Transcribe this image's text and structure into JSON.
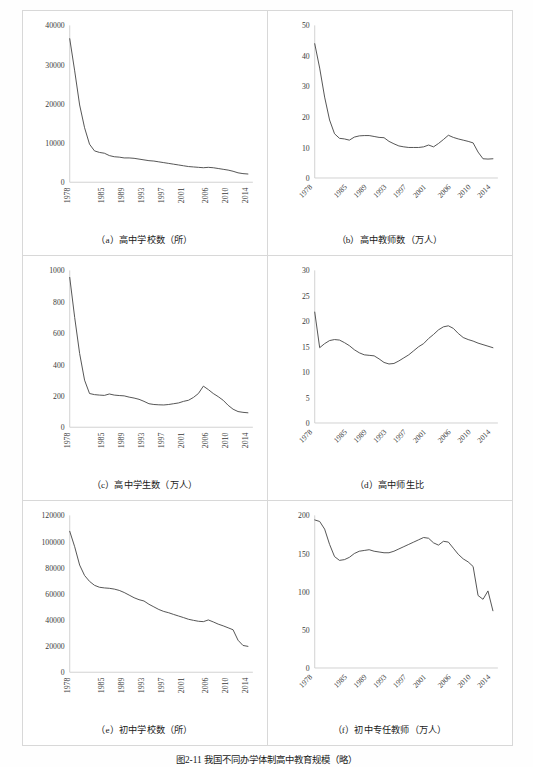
{
  "figure": {
    "caption": "图2-11  我国不同办学体制高中教育规模（略）"
  },
  "axis": {
    "xticks": [
      "1978",
      "1985",
      "1989",
      "1993",
      "1997",
      "2001",
      "2006",
      "2010",
      "2014"
    ],
    "xtick_positions": [
      1978,
      1985,
      1989,
      1993,
      1997,
      2001,
      2006,
      2010,
      2014
    ],
    "x_start": 1978,
    "x_end": 2015
  },
  "panels": [
    {
      "id": "a",
      "caption": "（a）高中学校数（所）"
    },
    {
      "id": "b",
      "caption": "（b）高中教师数（万人）"
    },
    {
      "id": "c",
      "caption": "（c）高中学生数（万人）"
    },
    {
      "id": "d",
      "caption": "（d）高中师生比"
    },
    {
      "id": "e",
      "caption": "（e）初中学校数（所）"
    },
    {
      "id": "f",
      "caption": "（f）初中专任教师（万人）"
    }
  ],
  "chart_data": [
    {
      "type": "line",
      "panel": "a",
      "title": "（a）高中学校数（所）",
      "xlabel": "",
      "ylabel": "所",
      "ylim": [
        0,
        40000
      ],
      "yticks": [
        0,
        10000,
        20000,
        30000,
        40000
      ],
      "xlim": [
        1978,
        2015
      ],
      "grid": false,
      "legend": "none",
      "x": [
        1978,
        1979,
        1980,
        1981,
        1982,
        1983,
        1984,
        1985,
        1986,
        1987,
        1988,
        1989,
        1990,
        1991,
        1992,
        1993,
        1994,
        1995,
        1996,
        1997,
        1998,
        1999,
        2000,
        2001,
        2002,
        2003,
        2004,
        2005,
        2006,
        2007,
        2008,
        2009,
        2010,
        2011,
        2012,
        2013,
        2014
      ],
      "values": [
        36600,
        28400,
        19700,
        13900,
        9700,
        8000,
        7600,
        7400,
        6800,
        6500,
        6400,
        6200,
        6200,
        6100,
        5900,
        5700,
        5500,
        5400,
        5200,
        5000,
        4800,
        4600,
        4400,
        4200,
        4000,
        3900,
        3800,
        3700,
        3800,
        3700,
        3500,
        3300,
        3100,
        2800,
        2400,
        2200,
        2100
      ]
    },
    {
      "type": "line",
      "panel": "b",
      "title": "（b）高中教师数（万人）",
      "xlabel": "",
      "ylabel": "万人",
      "ylim": [
        0,
        50
      ],
      "yticks": [
        0,
        10,
        20,
        30,
        40,
        50
      ],
      "xlim": [
        1978,
        2015
      ],
      "grid": false,
      "legend": "none",
      "x": [
        1978,
        1979,
        1980,
        1981,
        1982,
        1983,
        1984,
        1985,
        1986,
        1987,
        1988,
        1989,
        1990,
        1991,
        1992,
        1993,
        1994,
        1995,
        1996,
        1997,
        1998,
        1999,
        2000,
        2001,
        2002,
        2003,
        2004,
        2005,
        2006,
        2007,
        2008,
        2009,
        2010,
        2011,
        2012,
        2013,
        2014
      ],
      "values": [
        44.0,
        36.0,
        26.5,
        19.0,
        14.5,
        13.0,
        12.8,
        12.4,
        13.4,
        13.8,
        13.9,
        13.9,
        13.6,
        13.3,
        13.2,
        12.0,
        11.2,
        10.5,
        10.2,
        10.0,
        10.0,
        10.0,
        10.2,
        10.8,
        10.2,
        11.3,
        12.6,
        14.0,
        13.3,
        12.8,
        12.4,
        12.0,
        11.5,
        8.5,
        6.3,
        6.2,
        6.3
      ]
    },
    {
      "type": "line",
      "panel": "c",
      "title": "（c）高中学生数（万人）",
      "xlabel": "",
      "ylabel": "万人",
      "ylim": [
        0,
        1000
      ],
      "yticks": [
        0,
        200,
        400,
        600,
        800,
        1000
      ],
      "xlim": [
        1978,
        2015
      ],
      "grid": false,
      "legend": "none",
      "x": [
        1978,
        1979,
        1980,
        1981,
        1982,
        1983,
        1984,
        1985,
        1986,
        1987,
        1988,
        1989,
        1990,
        1991,
        1992,
        1993,
        1994,
        1995,
        1996,
        1997,
        1998,
        1999,
        2000,
        2001,
        2002,
        2003,
        2004,
        2005,
        2006,
        2007,
        2008,
        2009,
        2010,
        2011,
        2012,
        2013,
        2014
      ],
      "values": [
        955,
        700,
        470,
        300,
        215,
        208,
        205,
        203,
        212,
        205,
        202,
        200,
        192,
        186,
        178,
        165,
        150,
        145,
        143,
        142,
        145,
        150,
        155,
        165,
        172,
        190,
        215,
        262,
        240,
        215,
        195,
        172,
        140,
        115,
        100,
        95,
        92
      ]
    },
    {
      "type": "line",
      "panel": "d",
      "title": "（d）高中师生比",
      "xlabel": "",
      "ylabel": "",
      "ylim": [
        0,
        30
      ],
      "yticks": [
        0,
        5,
        10,
        15,
        20,
        25,
        30
      ],
      "xlim": [
        1978,
        2015
      ],
      "grid": false,
      "legend": "none",
      "x": [
        1978,
        1979,
        1980,
        1981,
        1982,
        1983,
        1984,
        1985,
        1986,
        1987,
        1988,
        1989,
        1990,
        1991,
        1992,
        1993,
        1994,
        1995,
        1996,
        1997,
        1998,
        1999,
        2000,
        2001,
        2002,
        2003,
        2004,
        2005,
        2006,
        2007,
        2008,
        2009,
        2010,
        2011,
        2012,
        2013,
        2014
      ],
      "values": [
        21.8,
        14.8,
        15.6,
        16.2,
        16.4,
        16.3,
        15.8,
        15.2,
        14.4,
        13.8,
        13.4,
        13.3,
        13.2,
        12.6,
        11.9,
        11.6,
        11.7,
        12.2,
        12.8,
        13.4,
        14.2,
        15.0,
        15.6,
        16.6,
        17.4,
        18.3,
        18.9,
        19.1,
        18.6,
        17.6,
        16.8,
        16.4,
        16.1,
        15.7,
        15.4,
        15.1,
        14.8
      ]
    },
    {
      "type": "line",
      "panel": "e",
      "title": "（e）初中学校数（所）",
      "xlabel": "",
      "ylabel": "所",
      "ylim": [
        0,
        120000
      ],
      "yticks": [
        0,
        20000,
        40000,
        60000,
        80000,
        100000,
        120000
      ],
      "xlim": [
        1978,
        2015
      ],
      "grid": false,
      "legend": "none",
      "x": [
        1978,
        1979,
        1980,
        1981,
        1982,
        1983,
        1984,
        1985,
        1986,
        1987,
        1988,
        1989,
        1990,
        1991,
        1992,
        1993,
        1994,
        1995,
        1996,
        1997,
        1998,
        1999,
        2000,
        2001,
        2002,
        2003,
        2004,
        2005,
        2006,
        2007,
        2008,
        2009,
        2010,
        2011,
        2012,
        2013,
        2014
      ],
      "values": [
        107800,
        96000,
        82000,
        74000,
        69500,
        66500,
        65000,
        64500,
        64200,
        63600,
        62600,
        61000,
        59000,
        57000,
        55500,
        54500,
        52000,
        50000,
        48000,
        46500,
        45500,
        44200,
        43000,
        41800,
        40500,
        39700,
        39000,
        38700,
        40000,
        38500,
        36800,
        35500,
        34000,
        32500,
        24500,
        20500,
        19800
      ]
    },
    {
      "type": "line",
      "panel": "f",
      "title": "（f）初中专任教师（万人）",
      "xlabel": "",
      "ylabel": "万人",
      "ylim": [
        0,
        200
      ],
      "yticks": [
        0,
        50,
        100,
        150,
        200
      ],
      "xlim": [
        1978,
        2015
      ],
      "grid": false,
      "legend": "none",
      "x": [
        1978,
        1979,
        1980,
        1981,
        1982,
        1983,
        1984,
        1985,
        1986,
        1987,
        1988,
        1989,
        1990,
        1991,
        1992,
        1993,
        1994,
        1995,
        1996,
        1997,
        1998,
        1999,
        2000,
        2001,
        2002,
        2003,
        2004,
        2005,
        2006,
        2007,
        2008,
        2009,
        2010,
        2011,
        2012,
        2013,
        2014
      ],
      "values": [
        194,
        192,
        182,
        162,
        146,
        141,
        142,
        145,
        150,
        153,
        154,
        155,
        153,
        152,
        151,
        151,
        153,
        156,
        159,
        162,
        165,
        168,
        171,
        170,
        164,
        161,
        166,
        165,
        157,
        149,
        143,
        139,
        133,
        95,
        90,
        101,
        75
      ]
    }
  ]
}
